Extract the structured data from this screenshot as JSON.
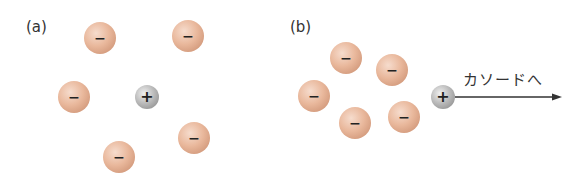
{
  "panels": [
    {
      "label": "(a)",
      "label_pos": [
        26,
        18
      ],
      "anions": [
        [
          100,
          38
        ],
        [
          188,
          36
        ],
        [
          74,
          97
        ],
        [
          194,
          138
        ],
        [
          119,
          157
        ]
      ],
      "cation": [
        147,
        97
      ]
    },
    {
      "label": "(b)",
      "label_pos": [
        290,
        18
      ],
      "anions": [
        [
          346,
          58
        ],
        [
          392,
          70
        ],
        [
          314,
          96
        ],
        [
          355,
          123
        ],
        [
          404,
          117
        ]
      ],
      "cation": [
        443,
        97
      ],
      "arrow": {
        "x1": 455,
        "x2": 562,
        "y": 97,
        "label": "カソードへ"
      }
    }
  ],
  "symbols": {
    "anion": "−",
    "cation": "+"
  },
  "colors": {
    "anion": "#e2ad90",
    "cation": "#a0a0a0",
    "arrow": "#333333"
  }
}
